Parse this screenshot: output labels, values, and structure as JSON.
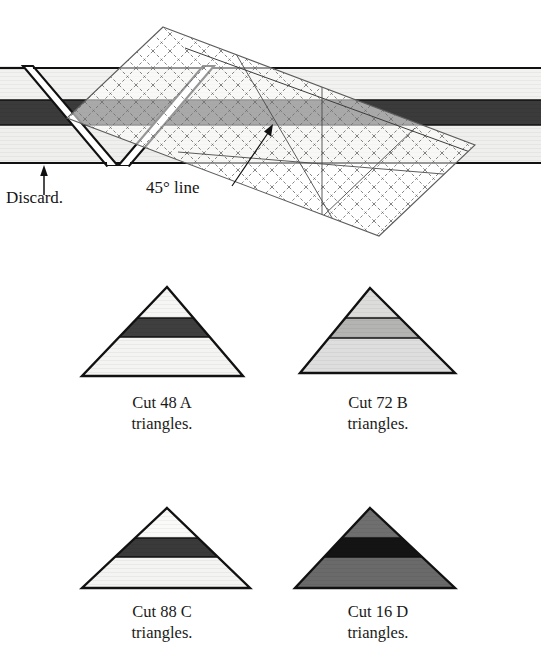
{
  "figure": {
    "kind": "quilting-cutting-diagram",
    "annotations": {
      "discard_label": "Discard.",
      "angle_label": "45° line"
    },
    "strip": {
      "name": "pieced-fabric-strip",
      "bands": [
        {
          "name": "top-band",
          "fill": "#f2f2f0"
        },
        {
          "name": "middle-band",
          "fill": "#3b3b3b"
        },
        {
          "name": "bottom-band",
          "fill": "#efefed"
        }
      ],
      "outline": "#111111"
    },
    "ruler": {
      "name": "45-degree-triangle-ruler",
      "grid_color": "#6b6b6b",
      "outline": "#5a5a5a",
      "tint": "#e8e8e6"
    },
    "triangles": [
      {
        "id": "A",
        "caption": "Cut 48 A\ntriangles.",
        "count": 48,
        "letter": "A",
        "bands": [
          {
            "name": "apex-band",
            "fill": "#f6f6f4"
          },
          {
            "name": "middle-band",
            "fill": "#3f3f3f"
          },
          {
            "name": "base-band",
            "fill": "#f4f4f2"
          }
        ]
      },
      {
        "id": "B",
        "caption": "Cut 72 B\ntriangles.",
        "count": 72,
        "letter": "B",
        "bands": [
          {
            "name": "apex-band",
            "fill": "#dcdcda"
          },
          {
            "name": "middle-band",
            "fill": "#b4b4b2"
          },
          {
            "name": "base-band",
            "fill": "#dedede"
          }
        ]
      },
      {
        "id": "C",
        "caption": "Cut 88 C\ntriangles.",
        "count": 88,
        "letter": "C",
        "bands": [
          {
            "name": "apex-band",
            "fill": "#fafaf8"
          },
          {
            "name": "middle-band",
            "fill": "#3a3a3a"
          },
          {
            "name": "base-band",
            "fill": "#f4f4f2"
          }
        ]
      },
      {
        "id": "D",
        "caption": "Cut 16 D\ntriangles.",
        "count": 16,
        "letter": "D",
        "bands": [
          {
            "name": "apex-band",
            "fill": "#6f6f6f"
          },
          {
            "name": "middle-band",
            "fill": "#141414"
          },
          {
            "name": "base-band",
            "fill": "#6a6a6a"
          }
        ]
      }
    ]
  }
}
